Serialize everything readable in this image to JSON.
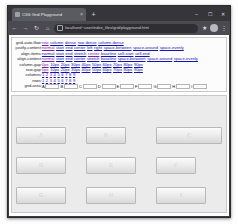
{
  "browser": {
    "tab": {
      "title": "CSS Grid Playground",
      "favicon": "globe-icon",
      "close": "×"
    },
    "new_tab": "+",
    "window_controls": {
      "minimize": "–",
      "maximize": "☐",
      "close": "✕"
    },
    "nav": {
      "back": "←",
      "forward": "→",
      "reload": "↻",
      "home": "⌂"
    },
    "url": "localhost/~user/index_files/grid/playground.html",
    "lock": "lock-icon",
    "toolbar_right": {
      "bookmark": "★",
      "extensions": "◈",
      "menu": "⋮"
    }
  },
  "panel": {
    "rows": [
      {
        "label": "grid-auto-flow:",
        "values": [
          "row",
          "column",
          "dense",
          "row dense",
          "column dense"
        ],
        "selected": 0
      },
      {
        "label": "justify-content:",
        "values": [
          "normal",
          "start",
          "end",
          "center",
          "left",
          "right",
          "space-between",
          "space-around",
          "space-evenly"
        ],
        "selected": 0
      },
      {
        "label": "align-items:",
        "values": [
          "normal",
          "start",
          "end",
          "stretch",
          "center",
          "baseline",
          "self-start",
          "self-end"
        ],
        "selected": 4
      },
      {
        "label": "align-content:",
        "values": [
          "normal",
          "start",
          "end",
          "center",
          "stretch",
          "baseline",
          "space-between",
          "space-around",
          "space-evenly"
        ],
        "selected": 0
      },
      {
        "label": "column-gap:",
        "values": [
          "0px",
          "10px",
          "20px",
          "30px",
          "40px",
          "50px",
          "60px",
          "70px",
          "80px",
          "90px"
        ],
        "selected": 0
      },
      {
        "label": "row-gap:",
        "values": [
          "0px",
          "10px",
          "20px",
          "30px",
          "40px",
          "50px",
          "60px",
          "70px",
          "80px",
          "90px"
        ],
        "selected": 0
      },
      {
        "label": "columns:",
        "values": [
          "1",
          "2",
          "3",
          "4",
          "5",
          "6",
          "7",
          "8",
          "9"
        ],
        "selected": 2
      },
      {
        "label": "rows:",
        "values": [
          "1",
          "2",
          "3",
          "4",
          "5",
          "6",
          "7",
          "8",
          "9"
        ],
        "selected": 2
      }
    ],
    "grid_area_label": "grid-area:",
    "grid_area_fields": [
      {
        "letter": "A",
        "value": ""
      },
      {
        "letter": "B",
        "value": ""
      },
      {
        "letter": "C",
        "value": ""
      },
      {
        "letter": "D",
        "value": ""
      },
      {
        "letter": "E",
        "value": ""
      },
      {
        "letter": "F",
        "value": ""
      },
      {
        "letter": "G",
        "value": ""
      },
      {
        "letter": "H",
        "value": ""
      },
      {
        "letter": "I",
        "value": ""
      }
    ]
  },
  "demo": {
    "items": [
      {
        "label": "A",
        "size": "med"
      },
      {
        "label": "B",
        "size": "sm"
      },
      {
        "label": "C",
        "size": "full"
      },
      {
        "label": "D",
        "size": "med"
      },
      {
        "label": "E",
        "size": "med"
      },
      {
        "label": "F",
        "size": "sm"
      },
      {
        "label": "G",
        "size": "med"
      },
      {
        "label": "H",
        "size": "med"
      },
      {
        "label": "I",
        "size": "med"
      }
    ]
  },
  "colors": {
    "link": "#1414b4",
    "link_visited": "#7a1ea1",
    "grid_background": "#ebebeb",
    "cell_border": "#b8b8b8",
    "chrome": "#3b3b40"
  }
}
